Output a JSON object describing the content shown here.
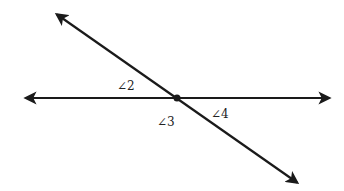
{
  "diagram": {
    "type": "intersecting-lines",
    "lines": [
      {
        "name": "horizontal-line",
        "from": [
          24,
          98
        ],
        "to": [
          331,
          98
        ],
        "arrows": "both"
      },
      {
        "name": "transversal-line",
        "from": [
          55,
          13
        ],
        "to": [
          299,
          184
        ],
        "arrows": "both"
      }
    ],
    "intersection": [
      177,
      98
    ],
    "labels": [
      {
        "id": "angle-2",
        "text": "∠2"
      },
      {
        "id": "angle-3",
        "text": "∠3"
      },
      {
        "id": "angle-4",
        "text": "∠4"
      }
    ],
    "colors": {
      "line": "#1a1a1a",
      "background": "#ffffff"
    }
  }
}
